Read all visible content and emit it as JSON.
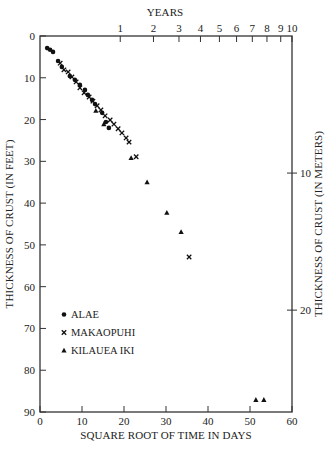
{
  "chart_data": {
    "type": "scatter",
    "title": "",
    "xlabel": "SQUARE ROOT OF TIME IN DAYS",
    "ylabel": "THICKNESS OF CRUST (IN FEET)",
    "y2label": "THICKNESS OF CRUST (IN METERS)",
    "x2label": "YEARS",
    "xlim": [
      0,
      60
    ],
    "ylim": [
      0,
      90
    ],
    "y_inverted": true,
    "grid": false,
    "legend_position": "bottom-left",
    "x_ticks": [
      0,
      10,
      20,
      30,
      40,
      50,
      60
    ],
    "y_ticks": [
      0,
      10,
      20,
      30,
      40,
      50,
      60,
      70,
      80,
      90
    ],
    "y2_ticks_meters": [
      10,
      20
    ],
    "x2_ticks_years": [
      1,
      2,
      3,
      4,
      5,
      6,
      7,
      8,
      9,
      10
    ],
    "series": [
      {
        "name": "ALAE",
        "marker": "circle",
        "points": [
          [
            1.7,
            2.9
          ],
          [
            2.4,
            3.3
          ],
          [
            3.1,
            3.8
          ],
          [
            4.3,
            6.0
          ],
          [
            5.2,
            7.4
          ],
          [
            7.1,
            9.6
          ],
          [
            8.3,
            10.5
          ],
          [
            9.5,
            11.7
          ],
          [
            10.7,
            12.9
          ],
          [
            11.4,
            14.1
          ],
          [
            12.4,
            15.3
          ],
          [
            13.1,
            16.3
          ],
          [
            14.8,
            18.4
          ],
          [
            15.7,
            20.6
          ],
          [
            16.4,
            22.0
          ]
        ]
      },
      {
        "name": "MAKAOPUHI",
        "marker": "x",
        "points": [
          [
            4.8,
            6.5
          ],
          [
            5.7,
            8.1
          ],
          [
            6.7,
            8.6
          ],
          [
            7.6,
            9.8
          ],
          [
            8.6,
            11.0
          ],
          [
            9.5,
            12.4
          ],
          [
            10.5,
            13.6
          ],
          [
            11.7,
            14.6
          ],
          [
            12.6,
            15.6
          ],
          [
            13.6,
            16.7
          ],
          [
            14.5,
            17.7
          ],
          [
            15.5,
            19.1
          ],
          [
            16.7,
            20.1
          ],
          [
            17.6,
            21.1
          ],
          [
            18.6,
            22.2
          ],
          [
            19.5,
            23.2
          ],
          [
            20.5,
            24.4
          ],
          [
            21.2,
            25.4
          ],
          [
            22.9,
            28.9
          ],
          [
            35.5,
            52.9
          ]
        ]
      },
      {
        "name": "KILAUEA IKI",
        "marker": "triangle",
        "points": [
          [
            13.3,
            17.9
          ],
          [
            15.2,
            21.1
          ],
          [
            21.7,
            29.2
          ],
          [
            25.5,
            35.0
          ],
          [
            30.2,
            42.3
          ],
          [
            33.6,
            46.9
          ],
          [
            51.4,
            87.1
          ],
          [
            53.3,
            87.1
          ]
        ]
      }
    ]
  }
}
